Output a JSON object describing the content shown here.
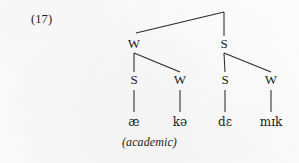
{
  "figure": {
    "example_number": "(17)",
    "gloss": "(academic)",
    "ink_color": "#1c1c1c",
    "line_color": "#2a2a2a",
    "background_color": "#fdfdfd"
  },
  "tree": {
    "type": "metrical-grid-tree",
    "root": {
      "label": "",
      "apex_x": 224,
      "apex_y": 12
    },
    "level1": [
      {
        "label": "W",
        "x": 134,
        "y": 44
      },
      {
        "label": "S",
        "x": 224,
        "y": 44
      }
    ],
    "level2": [
      {
        "label": "S",
        "x": 134,
        "y": 80,
        "parent": 0
      },
      {
        "label": "W",
        "x": 180,
        "y": 80,
        "parent": 0
      },
      {
        "label": "S",
        "x": 225,
        "y": 80,
        "parent": 1
      },
      {
        "label": "W",
        "x": 271,
        "y": 80,
        "parent": 1
      }
    ],
    "leaves": [
      {
        "label": "æ",
        "x": 134,
        "y": 122
      },
      {
        "label": "kə",
        "x": 180,
        "y": 122
      },
      {
        "label": "dɛ",
        "x": 225,
        "y": 122
      },
      {
        "label": "mɪk",
        "x": 271,
        "y": 122
      }
    ],
    "transcription": "æ kə dɛ mɪk"
  }
}
